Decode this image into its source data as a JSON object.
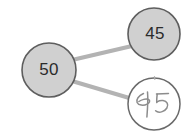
{
  "diagram": {
    "type": "node-link-tree",
    "background_color": "#ffffff",
    "node_fill_color": "#d0d0d0",
    "node_stroke_color": "#5e5e5e",
    "edge_color": "#b3b3b3",
    "sketch_stroke_color": "#8c8c8c",
    "nodes": [
      {
        "id": "root",
        "label": "50",
        "style": "filled-circle",
        "cx": 49,
        "cy": 70,
        "r": 27
      },
      {
        "id": "child-upper",
        "label": "45",
        "style": "filled-circle",
        "cx": 154,
        "cy": 34,
        "r": 26
      },
      {
        "id": "child-lower",
        "label": "45",
        "style": "handwritten-circle",
        "cx": 154,
        "cy": 104,
        "r": 26
      }
    ],
    "edges": [
      {
        "id": "edge-root-to-upper",
        "from": "root",
        "to": "child-upper"
      },
      {
        "id": "edge-root-to-lower",
        "from": "root",
        "to": "child-lower"
      }
    ]
  }
}
